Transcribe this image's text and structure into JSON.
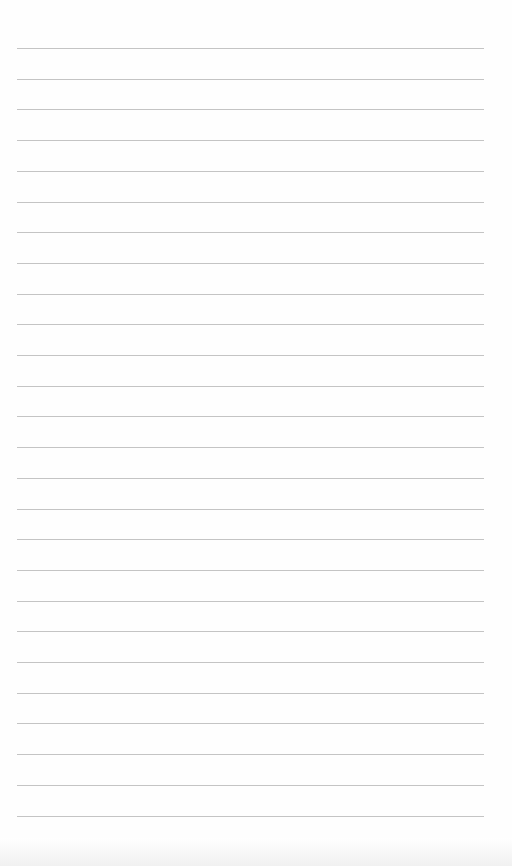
{
  "document": {
    "type": "blank lined paper",
    "line_count": 26,
    "first_line_y": 48,
    "line_spacing": 30.7,
    "line_left": 17,
    "line_right": 484,
    "line_color": "#c4c4c4",
    "paper_color": "#fefefe"
  }
}
